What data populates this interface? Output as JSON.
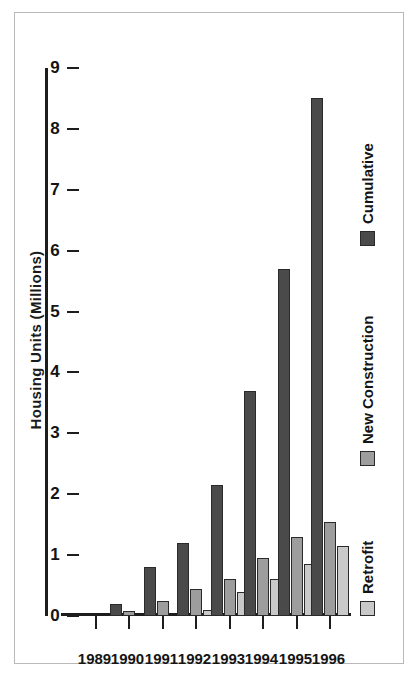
{
  "chart_data": {
    "type": "bar",
    "orientation": "horizontal-rotated",
    "title": "Housing Units (Millions)",
    "xlabel": "",
    "ylabel": "Housing Units (Millions)",
    "categories": [
      "1989",
      "1990",
      "1991",
      "1992",
      "1993",
      "1994",
      "1995",
      "1996"
    ],
    "value_axis": {
      "ticks": [
        "0",
        "1",
        "2",
        "3",
        "4",
        "5",
        "6",
        "7",
        "8",
        "9"
      ],
      "tick_values": [
        0,
        1,
        2,
        3,
        4,
        5,
        6,
        7,
        8,
        9
      ],
      "min": 0,
      "max": 9,
      "reversed": true,
      "grid": false
    },
    "legend": {
      "position": "bottom",
      "entries": [
        {
          "name": "Retrofit",
          "color": "#c9c9c9"
        },
        {
          "name": "New Construction",
          "color": "#9d9d9d"
        },
        {
          "name": "Cumulative",
          "color": "#4a4a4a"
        }
      ]
    },
    "series": [
      {
        "name": "Retrofit",
        "color": "#c9c9c9",
        "values": [
          0,
          0,
          0,
          0.1,
          0.4,
          0.6,
          0.85,
          1.15
        ]
      },
      {
        "name": "New Construction",
        "color": "#9d9d9d",
        "values": [
          0,
          0.08,
          0.25,
          0.45,
          0.6,
          0.95,
          1.3,
          1.55
        ]
      },
      {
        "name": "Cumulative",
        "color": "#4a4a4a",
        "values": [
          0,
          0.2,
          0.8,
          1.2,
          2.15,
          3.7,
          5.7,
          8.5
        ]
      }
    ]
  }
}
